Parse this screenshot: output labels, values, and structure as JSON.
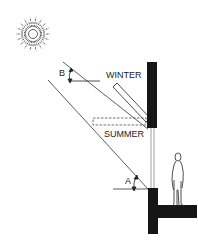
{
  "diagram": {
    "labels": {
      "winter": "WINTER",
      "summer": "SUMMER",
      "angle_b": "B",
      "angle_a": "A"
    },
    "elements": [
      {
        "name": "sun",
        "description": "sun with radiating rays"
      },
      {
        "name": "ray-b",
        "description": "high summer sun ray at angle B"
      },
      {
        "name": "ray-a",
        "description": "low winter sun ray at angle A"
      },
      {
        "name": "louver-winter",
        "description": "louver tilted (winter position)"
      },
      {
        "name": "louver-summer",
        "description": "louver horizontal, dashed (summer position)"
      },
      {
        "name": "wall-upper",
        "description": "solid upper wall section"
      },
      {
        "name": "glazing",
        "description": "window glazing"
      },
      {
        "name": "wall-lower",
        "description": "lower wall and floor slab"
      },
      {
        "name": "person",
        "description": "standing human figure for scale"
      }
    ],
    "colors": {
      "ink": "#1a1a1a",
      "wall": "#161616",
      "background": "#ffffff"
    }
  }
}
